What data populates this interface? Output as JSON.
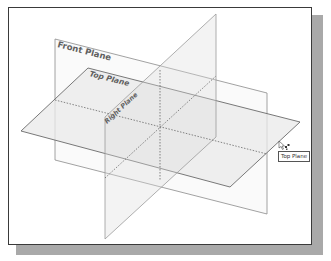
{
  "viewport": {
    "background": "#ffffff",
    "frame_border": "#3a3a3a",
    "shadow": "#a9a9a9"
  },
  "planes": {
    "front": {
      "label": "Front Plane"
    },
    "top": {
      "label": "Top Plane"
    },
    "right": {
      "label": "Right Plane"
    }
  },
  "tooltip": {
    "text": "Top Plane"
  },
  "cursor": {
    "icon": "select-plane-cursor-icon"
  }
}
